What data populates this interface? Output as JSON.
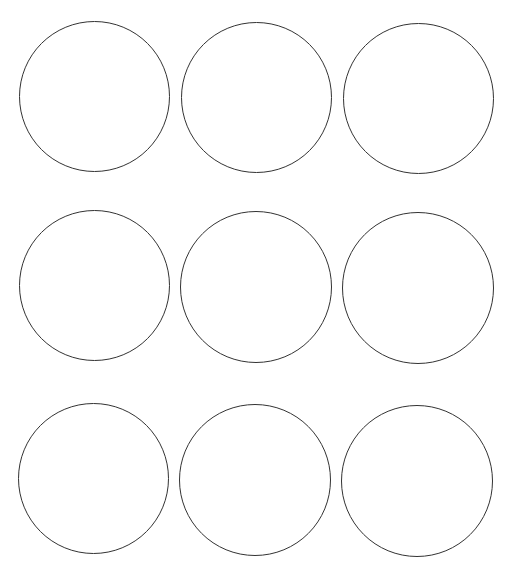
{
  "sheet": {
    "background": "#ffffff",
    "stroke_color": "#333333",
    "rows": 3,
    "columns": 3
  },
  "circles": [
    {
      "row": 1,
      "col": 1,
      "left": 19,
      "top": 21,
      "size": 151
    },
    {
      "row": 1,
      "col": 2,
      "left": 181,
      "top": 22,
      "size": 151
    },
    {
      "row": 1,
      "col": 3,
      "left": 343,
      "top": 23,
      "size": 151
    },
    {
      "row": 2,
      "col": 1,
      "left": 19,
      "top": 210,
      "size": 151
    },
    {
      "row": 2,
      "col": 2,
      "left": 180,
      "top": 211,
      "size": 152
    },
    {
      "row": 2,
      "col": 3,
      "left": 342,
      "top": 212,
      "size": 152
    },
    {
      "row": 3,
      "col": 1,
      "left": 18,
      "top": 403,
      "size": 151
    },
    {
      "row": 3,
      "col": 2,
      "left": 179,
      "top": 404,
      "size": 152
    },
    {
      "row": 3,
      "col": 3,
      "left": 341,
      "top": 405,
      "size": 152
    }
  ]
}
